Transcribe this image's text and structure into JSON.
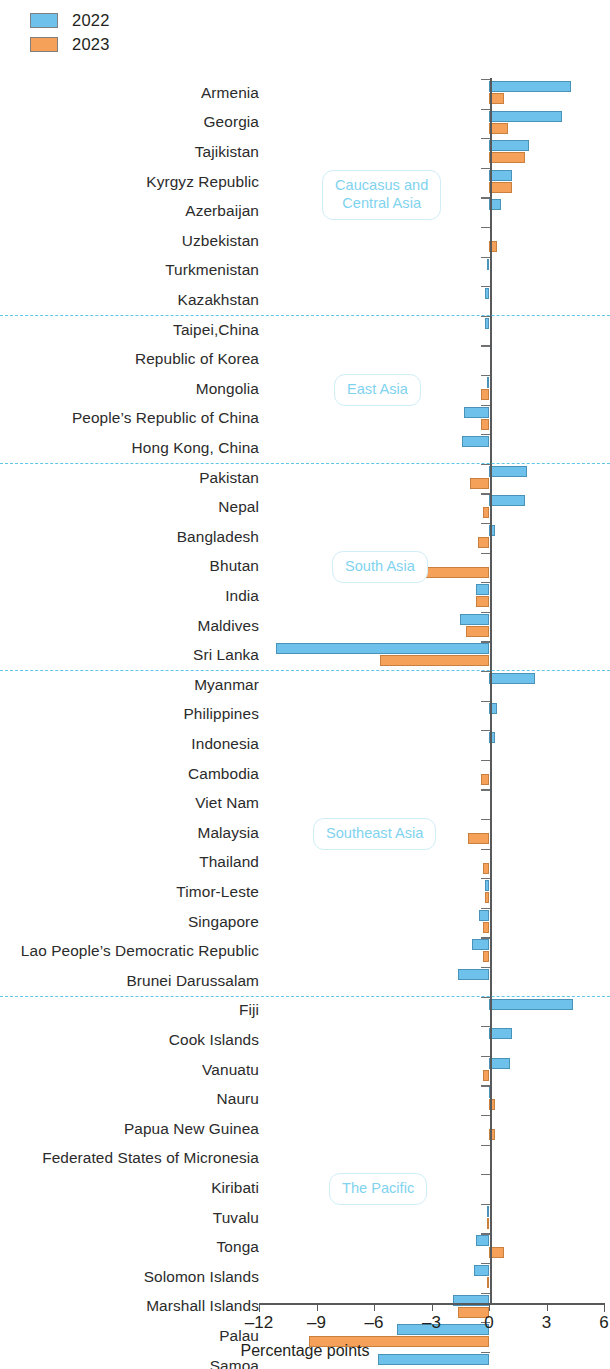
{
  "legend": {
    "items": [
      {
        "label": "2022",
        "color": "#6ec1ea"
      },
      {
        "label": "2023",
        "color": "#f6a159"
      }
    ]
  },
  "axis": {
    "title": "Percentage points",
    "ticks": [
      "-12",
      "-9",
      "-6",
      "-3",
      "0",
      "3",
      "6"
    ],
    "min": -12,
    "max": 6
  },
  "regions": [
    {
      "id": "caucasus",
      "label": "Caucasus and\nCentral Asia"
    },
    {
      "id": "east-asia",
      "label": "East Asia"
    },
    {
      "id": "south-asia",
      "label": "South Asia"
    },
    {
      "id": "southeast-asia",
      "label": "Southeast Asia"
    },
    {
      "id": "the-pacific",
      "label": "The Pacific"
    }
  ],
  "chart_data": {
    "type": "bar",
    "orientation": "horizontal",
    "title": "",
    "xlabel": "Percentage points",
    "ylabel": "",
    "xlim": [
      -12,
      6
    ],
    "grid": false,
    "legend_position": "top-left",
    "categories": [
      "Armenia",
      "Georgia",
      "Tajikistan",
      "Kyrgyz Republic",
      "Azerbaijan",
      "Uzbekistan",
      "Turkmenistan",
      "Kazakhstan",
      "Taipei,China",
      "Republic of Korea",
      "Mongolia",
      "People’s Republic of China",
      "Hong Kong, China",
      "Pakistan",
      "Nepal",
      "Bangladesh",
      "Bhutan",
      "India",
      "Maldives",
      "Sri Lanka",
      "Myanmar",
      "Philippines",
      "Indonesia",
      "Cambodia",
      "Viet Nam",
      "Malaysia",
      "Thailand",
      "Timor-Leste",
      "Singapore",
      "Lao People’s Democratic Republic",
      "Brunei Darussalam",
      "Fiji",
      "Cook Islands",
      "Vanuatu",
      "Nauru",
      "Papua New Guinea",
      "Federated States of Micronesia",
      "Kiribati",
      "Tuvalu",
      "Tonga",
      "Solomon Islands",
      "Marshall Islands",
      "Palau",
      "Samoa"
    ],
    "group_of_category": [
      "caucasus",
      "caucasus",
      "caucasus",
      "caucasus",
      "caucasus",
      "caucasus",
      "caucasus",
      "caucasus",
      "east-asia",
      "east-asia",
      "east-asia",
      "east-asia",
      "east-asia",
      "south-asia",
      "south-asia",
      "south-asia",
      "south-asia",
      "south-asia",
      "south-asia",
      "south-asia",
      "southeast-asia",
      "southeast-asia",
      "southeast-asia",
      "southeast-asia",
      "southeast-asia",
      "southeast-asia",
      "southeast-asia",
      "southeast-asia",
      "southeast-asia",
      "southeast-asia",
      "southeast-asia",
      "the-pacific",
      "the-pacific",
      "the-pacific",
      "the-pacific",
      "the-pacific",
      "the-pacific",
      "the-pacific",
      "the-pacific",
      "the-pacific",
      "the-pacific",
      "the-pacific",
      "the-pacific",
      "the-pacific"
    ],
    "series": [
      {
        "name": "2022",
        "color": "#6ec1ea",
        "values": [
          4.3,
          3.8,
          2.1,
          1.2,
          0.6,
          0.0,
          -0.1,
          -0.2,
          -0.2,
          0.0,
          -0.1,
          -1.3,
          -1.4,
          2.0,
          1.9,
          0.3,
          0.0,
          -0.7,
          -1.5,
          -11.1,
          2.4,
          0.4,
          0.3,
          0.0,
          0.0,
          0.0,
          0.0,
          -0.2,
          -0.5,
          -0.9,
          -1.6,
          4.4,
          1.2,
          1.1,
          0.1,
          0.0,
          0.0,
          0.0,
          -0.1,
          -0.7,
          -0.8,
          -1.9,
          -4.8,
          -5.8
        ]
      },
      {
        "name": "2023",
        "color": "#f6a159",
        "values": [
          0.8,
          1.0,
          1.9,
          1.2,
          0.0,
          0.4,
          0.0,
          0.0,
          0.0,
          0.0,
          -0.4,
          -0.4,
          0.0,
          -1.0,
          -0.3,
          -0.6,
          -3.3,
          -0.7,
          -1.2,
          -5.7,
          0.0,
          0.0,
          0.0,
          -0.4,
          0.0,
          -1.1,
          -0.3,
          -0.2,
          -0.3,
          -0.3,
          0.0,
          0.0,
          0.0,
          -0.3,
          0.3,
          0.3,
          0.0,
          0.0,
          -0.1,
          0.8,
          -0.1,
          -1.6,
          -9.4,
          0.0
        ]
      }
    ]
  }
}
